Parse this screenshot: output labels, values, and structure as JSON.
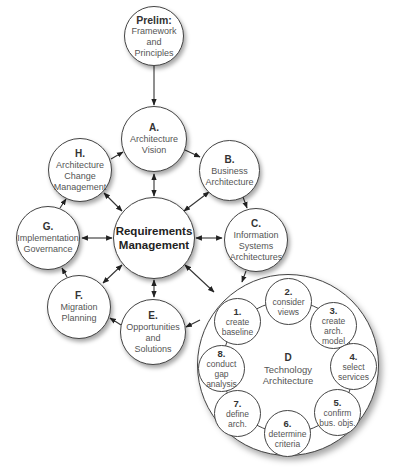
{
  "diagram": {
    "prelim": {
      "code": "Prelim:",
      "label": "Framework\nand\nPrinciples"
    },
    "phases": {
      "A": {
        "code": "A.",
        "label": "Architecture\nVision"
      },
      "B": {
        "code": "B.",
        "label": "Business\nArchitecture"
      },
      "C": {
        "code": "C.",
        "label": "Information\nSystems\nArchitectures"
      },
      "D": {
        "code": "D",
        "label": "Technology\nArchitecture"
      },
      "E": {
        "code": "E.",
        "label": "Opportunities\nand\nSolutions"
      },
      "F": {
        "code": "F.",
        "label": "Migration\nPlanning"
      },
      "G": {
        "code": "G.",
        "label": "Implementation\nGovernance"
      },
      "H": {
        "code": "H.",
        "label": "Architecture\nChange\nManagement"
      }
    },
    "center": {
      "label": "Requirements\nManagement"
    },
    "d_steps": [
      {
        "code": "1.",
        "label": "create\nbaseline"
      },
      {
        "code": "2.",
        "label": "consider\nviews"
      },
      {
        "code": "3.",
        "label": "create\narch.\nmodel"
      },
      {
        "code": "4.",
        "label": "select\nservices"
      },
      {
        "code": "5.",
        "label": "confirm\nbus. objs."
      },
      {
        "code": "6.",
        "label": "determine\ncriteria"
      },
      {
        "code": "7.",
        "label": "define\narch."
      },
      {
        "code": "8.",
        "label": "conduct\ngap\nanalysis"
      }
    ],
    "colors": {
      "stroke": "#444444",
      "text": "#555555",
      "bold_text": "#333333",
      "background": "#ffffff"
    }
  }
}
